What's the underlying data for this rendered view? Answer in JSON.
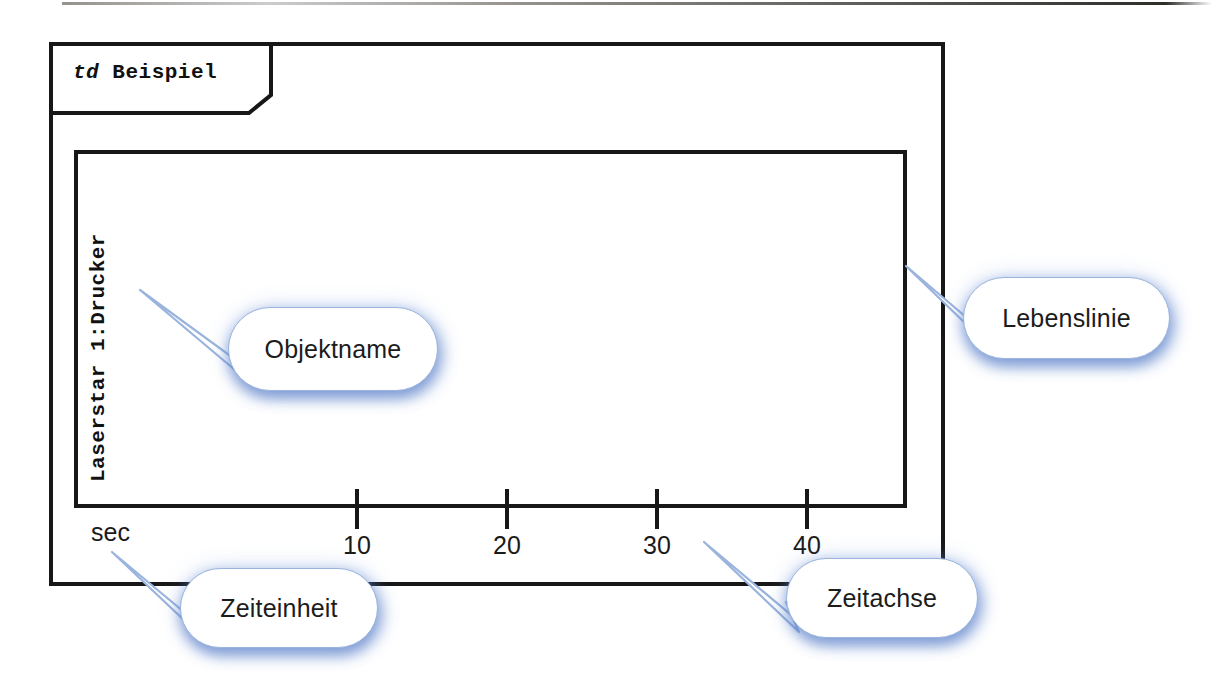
{
  "diagram": {
    "kind_keyword": "td",
    "name": "Beispiel",
    "type": "uml-timing-diagram"
  },
  "lifeline": {
    "object_name": "Laserstar 1:Drucker"
  },
  "time_axis": {
    "unit_label": "sec",
    "ticks": [
      {
        "label": "10",
        "value": 10,
        "x": 357
      },
      {
        "label": "20",
        "value": 20,
        "x": 507
      },
      {
        "label": "30",
        "value": 30,
        "x": 657
      },
      {
        "label": "40",
        "value": 40,
        "x": 807
      }
    ]
  },
  "annotations": [
    {
      "id": "objektname",
      "label": "Objektname",
      "points_to": "object-name"
    },
    {
      "id": "lebenslinie",
      "label": "Lebenslinie",
      "points_to": "lifeline-box-right-edge"
    },
    {
      "id": "zeiteinheit",
      "label": "Zeiteinheit",
      "points_to": "time-axis-unit"
    },
    {
      "id": "zeitachse",
      "label": "Zeitachse",
      "points_to": "time-axis"
    }
  ],
  "colors": {
    "stroke": "#171717",
    "callout_border": "#9ab4dd",
    "callout_glow": "#567cc7",
    "background": "#ffffff"
  }
}
